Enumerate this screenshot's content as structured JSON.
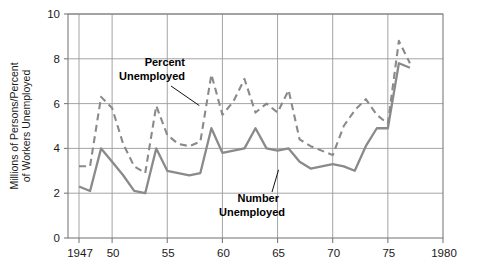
{
  "chart_data": {
    "type": "line",
    "title": "",
    "subtitle": "",
    "xlabel": "",
    "ylabel": "Millions of Persons/Percent of Workers Unemployed",
    "ylabel_line1": "Millions of Persons/Percent",
    "ylabel_line2": "of Workers Unemployed",
    "xlim": [
      1946,
      1980
    ],
    "ylim": [
      0,
      10
    ],
    "x_ticks": [
      1947,
      1950,
      1955,
      1960,
      1965,
      1970,
      1975,
      1980
    ],
    "x_tick_labels": [
      "1947",
      "50",
      "55",
      "60",
      "65",
      "70",
      "75",
      "1980"
    ],
    "y_ticks": [
      0,
      2,
      4,
      6,
      8,
      10
    ],
    "y_tick_labels": [
      "0",
      "2",
      "4",
      "6",
      "8",
      "10"
    ],
    "grid": true,
    "grid_color": "#9a9a9a",
    "legend": "annotations",
    "line_color": "#8a8a8a",
    "annotations": [
      {
        "text_line1": "Percent",
        "text_line2": "Unemployed",
        "text": "Percent Unemployed",
        "target_x": 1958,
        "target_y": 6.0
      },
      {
        "text_line1": "Number",
        "text_line2": "Unemployed",
        "text": "Number Unemployed",
        "target_x": 1965,
        "target_y": 3.0
      }
    ],
    "x": [
      1947,
      1948,
      1949,
      1950,
      1951,
      1952,
      1953,
      1954,
      1955,
      1956,
      1957,
      1958,
      1959,
      1960,
      1961,
      1962,
      1963,
      1964,
      1965,
      1966,
      1967,
      1968,
      1969,
      1970,
      1971,
      1972,
      1973,
      1974,
      1975,
      1976,
      1977
    ],
    "series": [
      {
        "name": "Percent Unemployed",
        "style": "dashed",
        "unit": "percent of workers",
        "values": [
          3.2,
          3.2,
          6.3,
          5.8,
          4.2,
          3.2,
          2.9,
          5.9,
          4.6,
          4.2,
          4.1,
          4.3,
          7.3,
          5.5,
          6.1,
          7.1,
          5.6,
          6.0,
          5.6,
          6.6,
          4.4,
          4.1,
          3.9,
          3.7,
          5.0,
          5.7,
          6.2,
          5.5,
          5.1,
          8.8,
          7.8
        ]
      },
      {
        "name": "Number Unemployed",
        "style": "solid",
        "unit": "millions of persons",
        "values": [
          2.3,
          2.1,
          4.0,
          3.4,
          2.8,
          2.1,
          2.0,
          4.0,
          3.0,
          2.9,
          2.8,
          2.9,
          4.9,
          3.8,
          3.9,
          4.0,
          4.9,
          4.0,
          3.9,
          4.0,
          3.4,
          3.1,
          3.2,
          3.3,
          3.2,
          3.0,
          4.1,
          4.9,
          4.9,
          7.8,
          7.6
        ]
      }
    ]
  }
}
